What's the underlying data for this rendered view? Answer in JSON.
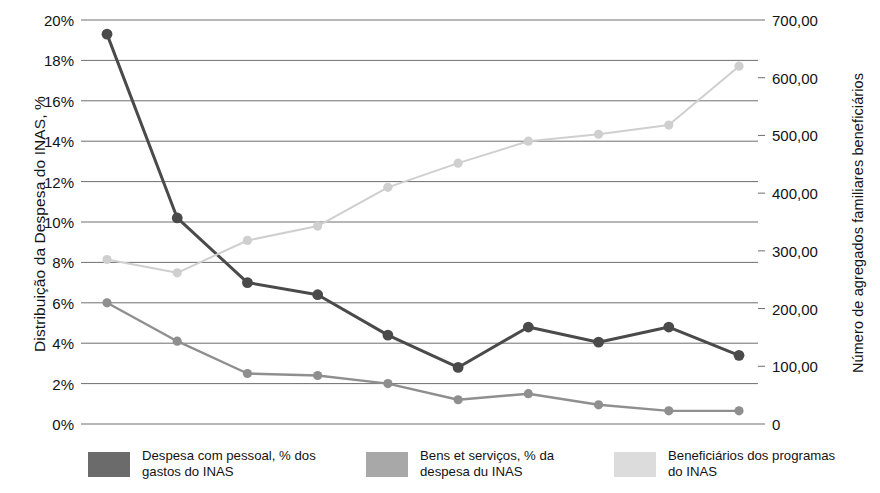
{
  "chart_data": {
    "type": "line",
    "title": "",
    "xlabel": "",
    "ylabel": "Distribuição da Despesa do INAS, %",
    "y2label": "Número de agregados familiares beneficiários",
    "grid": true,
    "legend_position": "bottom",
    "x": [
      1,
      2,
      3,
      4,
      5,
      6,
      7,
      8,
      9,
      10
    ],
    "ylim": [
      0,
      20
    ],
    "y2lim": [
      0,
      700
    ],
    "y_tick_labels": [
      "20%",
      "18%",
      "16%",
      "14%",
      "12%",
      "10%",
      "8%",
      "6%",
      "4%",
      "2%",
      "0%"
    ],
    "y_tick_values": [
      20,
      18,
      16,
      14,
      12,
      10,
      8,
      6,
      4,
      2,
      0
    ],
    "y2_tick_labels": [
      "700,00",
      "600,00",
      "500,00",
      "400,00",
      "300,00",
      "200,00",
      "100,00",
      "0"
    ],
    "y2_tick_values": [
      700,
      600,
      500,
      400,
      300,
      200,
      100,
      0
    ],
    "series": [
      {
        "name": "Despesa com pessoal, % dos gastos do INAS",
        "axis": "left",
        "color": "#4a4a4a",
        "values": [
          19.3,
          10.2,
          7.0,
          6.4,
          4.4,
          2.8,
          4.8,
          4.05,
          4.8,
          3.4
        ]
      },
      {
        "name": "Bens et serviços, % da despesa du INAS",
        "axis": "left",
        "color": "#8f8f8f",
        "values": [
          6.0,
          4.1,
          2.5,
          2.4,
          2.0,
          1.2,
          1.5,
          0.95,
          0.65,
          0.65
        ]
      },
      {
        "name": "Beneficiários dos programas do INAS",
        "axis": "right",
        "color": "#cfcfcf",
        "values": [
          285,
          262,
          318,
          343,
          410,
          452,
          490,
          502,
          518,
          620
        ]
      }
    ]
  },
  "axes": {
    "left_title": "Distribuição da Despesa do INAS, %",
    "right_title": "Número de agregados familiares beneficiários"
  },
  "legend": {
    "entries": [
      {
        "label": "Despesa com pessoal, % dos gastos do INAS",
        "color": "#6b6b6b"
      },
      {
        "label": "Bens et serviços, % da despesa du INAS",
        "color": "#a8a8a8"
      },
      {
        "label": "Beneficiários dos programas do INAS",
        "color": "#dcdcdc"
      }
    ]
  }
}
